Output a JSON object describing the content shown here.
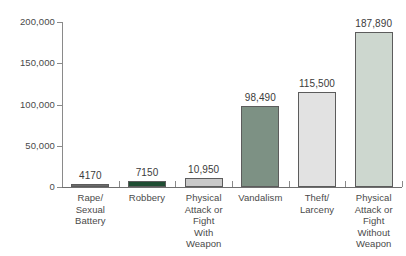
{
  "chart_data": {
    "type": "bar",
    "title": "",
    "subtitle": "",
    "xlabel": "",
    "ylabel": "",
    "ylim": [
      0,
      200000
    ],
    "grid": false,
    "legend": false,
    "legend_position": "none",
    "y_ticks": [
      {
        "value": 0,
        "label": "0"
      },
      {
        "value": 50000,
        "label": "50,000"
      },
      {
        "value": 100000,
        "label": "100,000"
      },
      {
        "value": 150000,
        "label": "150,000"
      },
      {
        "value": 200000,
        "label": "200,000"
      }
    ],
    "categories": [
      "Rape/ Sexual Battery",
      "Robbery",
      "Physical Attack or Fight With Weapon",
      "Vandalism",
      "Theft/ Larceny",
      "Physical Attack or Fight Without Weapon"
    ],
    "category_lines": [
      [
        "Rape/",
        "Sexual",
        "Battery"
      ],
      [
        "Robbery"
      ],
      [
        "Physical",
        "Attack or",
        "Fight",
        "With",
        "Weapon"
      ],
      [
        "Vandalism"
      ],
      [
        "Theft/",
        "Larceny"
      ],
      [
        "Physical",
        "Attack or",
        "Fight",
        "Without",
        "Weapon"
      ]
    ],
    "values": [
      4170,
      7150,
      10950,
      98490,
      115500,
      187890
    ],
    "value_labels": [
      "4170",
      "7150",
      "10,950",
      "98,490",
      "115,500",
      "187,890"
    ],
    "bar_colors": [
      "#6b6b6b",
      "#1f4d33",
      "#c9c9c9",
      "#7d9184",
      "#e2e2e2",
      "#cdd7cf"
    ],
    "bar_border_color": "#5c5c5c",
    "axis_color": "#8a8a8a",
    "text_color": "#3b3b3b"
  }
}
